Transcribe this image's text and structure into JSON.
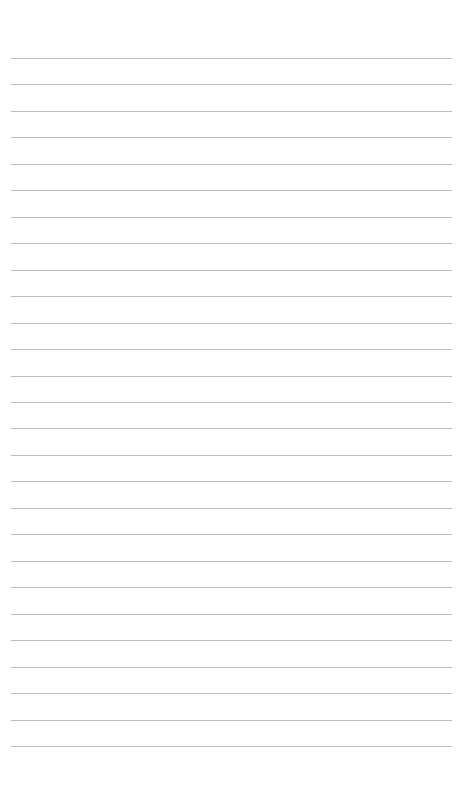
{
  "page": {
    "type": "lined-paper",
    "background_color": "#ffffff",
    "line_color": "#bdbdbd",
    "line_count": 27,
    "first_line_y": 58,
    "line_spacing": 26.46,
    "line_left": 11,
    "line_width": 441
  }
}
